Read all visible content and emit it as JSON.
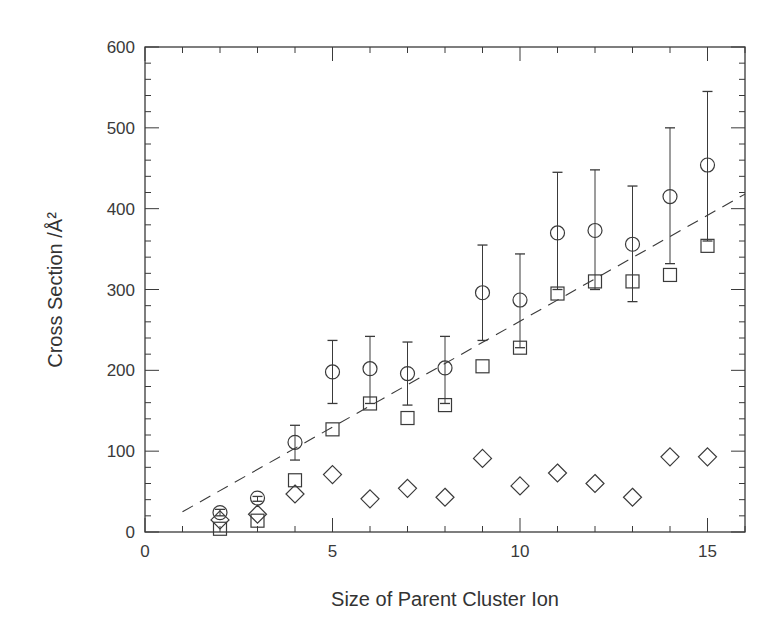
{
  "chart_data": {
    "type": "scatter",
    "title": "",
    "xlabel": "Size of Parent Cluster Ion",
    "ylabel": "Cross Section /Å²",
    "xlim": [
      0,
      16
    ],
    "ylim": [
      0,
      600
    ],
    "x_ticks": [
      0,
      5,
      10,
      15
    ],
    "y_ticks": [
      0,
      100,
      200,
      300,
      400,
      500,
      600
    ],
    "grid": false,
    "legend": null,
    "series": [
      {
        "name": "circles",
        "marker": "circle",
        "x": [
          2,
          3,
          4,
          5,
          6,
          7,
          8,
          9,
          10,
          11,
          12,
          13,
          14,
          15
        ],
        "values": [
          24,
          42,
          111,
          198,
          202,
          196,
          203,
          296,
          287,
          370,
          373,
          356,
          415,
          454
        ],
        "error_upper": [
          28,
          44,
          132,
          237,
          242,
          235,
          242,
          355,
          344,
          445,
          448,
          428,
          500,
          545
        ],
        "error_lower": [
          20,
          38,
          89,
          159,
          159,
          157,
          159,
          237,
          228,
          300,
          300,
          285,
          332,
          360
        ]
      },
      {
        "name": "squares",
        "marker": "square",
        "x": [
          2,
          3,
          4,
          5,
          6,
          7,
          8,
          9,
          10,
          11,
          12,
          13,
          14,
          15
        ],
        "values": [
          4,
          14,
          64,
          127,
          159,
          141,
          157,
          205,
          228,
          295,
          310,
          310,
          318,
          354
        ]
      },
      {
        "name": "diamonds",
        "marker": "diamond",
        "x": [
          2,
          3,
          4,
          5,
          6,
          7,
          8,
          9,
          10,
          11,
          12,
          13,
          14,
          15
        ],
        "values": [
          15,
          22,
          47,
          71,
          41,
          54,
          43,
          91,
          57,
          73,
          60,
          43,
          93,
          93
        ]
      },
      {
        "name": "fit",
        "marker": "dashed-line",
        "x": [
          1,
          16
        ],
        "values": [
          25,
          418
        ]
      }
    ]
  }
}
